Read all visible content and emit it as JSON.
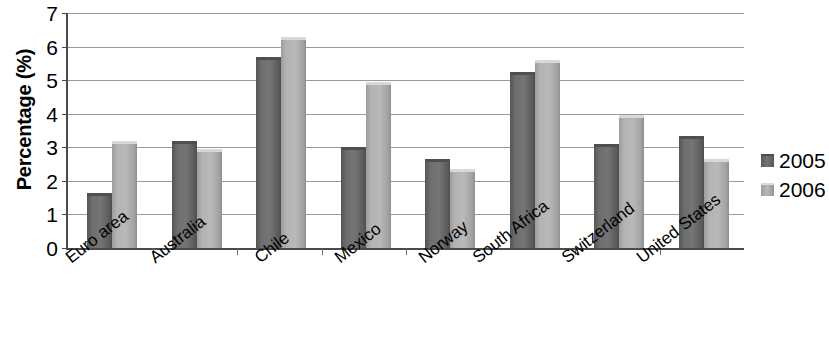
{
  "chart_data": {
    "type": "bar",
    "title": "",
    "xlabel": "",
    "ylabel": "Percentage (%)",
    "ylim": [
      0,
      7
    ],
    "ytick_labels": [
      "7",
      "6",
      "5",
      "4",
      "3",
      "2",
      "1",
      "0"
    ],
    "yticks": [
      7,
      6,
      5,
      4,
      3,
      2,
      1,
      0
    ],
    "grid": true,
    "legend_position": "right",
    "categories": [
      "Euro area",
      "Australia",
      "Chile",
      "Mexico",
      "Norway",
      "South Africa",
      "Switzerland",
      "United States"
    ],
    "series": [
      {
        "name": "2005",
        "color": "#6e6e6e",
        "values": [
          1.65,
          3.2,
          5.7,
          3.0,
          2.65,
          5.25,
          3.1,
          3.35
        ]
      },
      {
        "name": "2006",
        "color": "#b3b3b3",
        "values": [
          3.2,
          2.95,
          6.3,
          4.95,
          2.35,
          5.6,
          3.95,
          2.65
        ]
      }
    ]
  },
  "legend": {
    "entries": [
      {
        "label": "2005"
      },
      {
        "label": "2006"
      }
    ]
  },
  "colors": {
    "axis": "#4a4a4a",
    "gridline": "#9a9a9a",
    "background": "#ffffff",
    "series_2005": "#6e6e6e",
    "series_2006": "#b3b3b3"
  }
}
